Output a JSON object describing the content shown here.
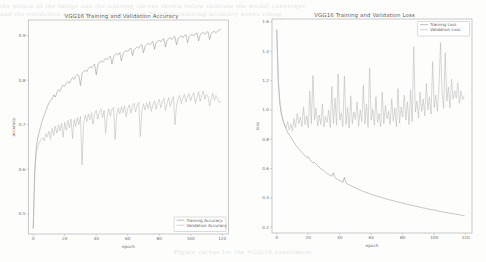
{
  "page": {
    "background_color": "#fdfdfc",
    "ghost_text_top_1": "the  nature  of  the  image  and  the  training  curves  shown  below  indicate  the  model  converges",
    "ghost_text_top_2": "and  the  validation  accuracy  plateaus  near  0.75  while  training  accuracy  keeps  rising",
    "ghost_text_bottom": "Figure  curves  for  the  VGG16  experiment"
  },
  "colors": {
    "training": "#8f8f8f",
    "validation": "#b4b4b4",
    "axis": "#a9a9a9",
    "text": "#6b6b6b"
  },
  "charts": [
    {
      "id": "accuracy-chart",
      "title": "VGG16 Training and Validation Accuracy",
      "xlabel": "epoch",
      "ylabel": "accuracy",
      "legend_position": "lower right",
      "legend": [
        "Training Accuracy",
        "Validation Accuracy"
      ]
    },
    {
      "id": "loss-chart",
      "title": "VGG16 Training and Validation Loss",
      "xlabel": "epoch",
      "ylabel": "loss",
      "legend_position": "upper right",
      "legend": [
        "Training Loss",
        "Validation Loss"
      ]
    }
  ],
  "chart_data": [
    {
      "type": "line",
      "title": "VGG16 Training and Validation Accuracy",
      "xlabel": "epoch",
      "ylabel": "accuracy",
      "xlim": [
        -3,
        124
      ],
      "ylim": [
        0.455,
        0.935
      ],
      "xticks": [
        0,
        20,
        40,
        60,
        80,
        100,
        120
      ],
      "yticks": [
        0.5,
        0.6,
        0.7,
        0.8,
        0.9
      ],
      "xticklabels": [
        "0",
        "20",
        "40",
        "60",
        "80",
        "100",
        "120"
      ],
      "yticklabels": [
        "0.5",
        "0.6",
        "0.7",
        "0.8",
        "0.9"
      ],
      "grid": false,
      "legend": [
        "Training Accuracy",
        "Validation Accuracy"
      ],
      "legend_position": "lower right",
      "x": [
        0,
        1,
        2,
        3,
        4,
        5,
        6,
        7,
        8,
        9,
        10,
        11,
        12,
        13,
        14,
        15,
        16,
        17,
        18,
        19,
        20,
        21,
        22,
        23,
        24,
        25,
        26,
        27,
        28,
        29,
        30,
        31,
        32,
        33,
        34,
        35,
        36,
        37,
        38,
        39,
        40,
        41,
        42,
        43,
        44,
        45,
        46,
        47,
        48,
        49,
        50,
        51,
        52,
        53,
        54,
        55,
        56,
        57,
        58,
        59,
        60,
        61,
        62,
        63,
        64,
        65,
        66,
        67,
        68,
        69,
        70,
        71,
        72,
        73,
        74,
        75,
        76,
        77,
        78,
        79,
        80,
        81,
        82,
        83,
        84,
        85,
        86,
        87,
        88,
        89,
        90,
        91,
        92,
        93,
        94,
        95,
        96,
        97,
        98,
        99,
        100,
        101,
        102,
        103,
        104,
        105,
        106,
        107,
        108,
        109,
        110,
        111,
        112,
        113,
        114,
        115,
        116,
        117,
        118,
        119
      ],
      "series": [
        {
          "name": "Training Accuracy",
          "color": "#8f8f8f",
          "values": [
            0.468,
            0.601,
            0.652,
            0.672,
            0.686,
            0.7,
            0.712,
            0.722,
            0.731,
            0.741,
            0.749,
            0.755,
            0.758,
            0.767,
            0.762,
            0.772,
            0.779,
            0.775,
            0.784,
            0.789,
            0.786,
            0.793,
            0.797,
            0.793,
            0.801,
            0.806,
            0.802,
            0.809,
            0.813,
            0.81,
            0.788,
            0.815,
            0.82,
            0.822,
            0.819,
            0.826,
            0.83,
            0.827,
            0.833,
            0.836,
            0.812,
            0.834,
            0.84,
            0.843,
            0.84,
            0.845,
            0.849,
            0.846,
            0.851,
            0.854,
            0.836,
            0.852,
            0.857,
            0.86,
            0.857,
            0.862,
            0.843,
            0.859,
            0.864,
            0.867,
            0.864,
            0.869,
            0.872,
            0.855,
            0.868,
            0.872,
            0.875,
            0.872,
            0.877,
            0.88,
            0.861,
            0.876,
            0.88,
            0.883,
            0.879,
            0.884,
            0.887,
            0.869,
            0.883,
            0.887,
            0.89,
            0.886,
            0.891,
            0.893,
            0.874,
            0.889,
            0.893,
            0.895,
            0.891,
            0.896,
            0.898,
            0.879,
            0.894,
            0.897,
            0.9,
            0.895,
            0.9,
            0.902,
            0.884,
            0.898,
            0.901,
            0.903,
            0.899,
            0.904,
            0.906,
            0.888,
            0.901,
            0.905,
            0.907,
            0.903,
            0.907,
            0.909,
            0.891,
            0.904,
            0.908,
            0.91,
            0.906,
            0.91,
            0.912,
            0.914
          ]
        },
        {
          "name": "Validation Accuracy",
          "color": "#b4b4b4",
          "values": [
            0.468,
            0.591,
            0.64,
            0.653,
            0.662,
            0.667,
            0.671,
            0.664,
            0.68,
            0.673,
            0.686,
            0.668,
            0.692,
            0.676,
            0.697,
            0.681,
            0.7,
            0.686,
            0.703,
            0.672,
            0.706,
            0.688,
            0.71,
            0.693,
            0.713,
            0.669,
            0.712,
            0.696,
            0.716,
            0.7,
            0.719,
            0.61,
            0.703,
            0.722,
            0.707,
            0.724,
            0.711,
            0.727,
            0.701,
            0.725,
            0.732,
            0.713,
            0.729,
            0.735,
            0.716,
            0.732,
            0.681,
            0.72,
            0.736,
            0.719,
            0.734,
            0.739,
            0.667,
            0.722,
            0.738,
            0.724,
            0.741,
            0.727,
            0.743,
            0.718,
            0.736,
            0.745,
            0.726,
            0.742,
            0.748,
            0.729,
            0.744,
            0.75,
            0.673,
            0.731,
            0.747,
            0.733,
            0.749,
            0.736,
            0.752,
            0.73,
            0.745,
            0.754,
            0.735,
            0.75,
            0.757,
            0.738,
            0.753,
            0.759,
            0.732,
            0.748,
            0.761,
            0.741,
            0.755,
            0.763,
            0.7,
            0.744,
            0.758,
            0.766,
            0.748,
            0.76,
            0.768,
            0.751,
            0.762,
            0.77,
            0.754,
            0.765,
            0.772,
            0.748,
            0.76,
            0.774,
            0.752,
            0.766,
            0.776,
            0.757,
            0.768,
            0.763,
            0.742,
            0.758,
            0.771,
            0.755,
            0.766,
            0.76,
            0.75,
            0.752
          ]
        }
      ]
    },
    {
      "type": "line",
      "title": "VGG16 Training and Validation Loss",
      "xlabel": "epoch",
      "ylabel": "loss",
      "xlim": [
        -3,
        124
      ],
      "ylim": [
        0.16,
        1.62
      ],
      "xticks": [
        0,
        20,
        40,
        60,
        80,
        100,
        120
      ],
      "yticks": [
        0.2,
        0.4,
        0.6,
        0.8,
        1.0,
        1.2,
        1.4,
        1.6
      ],
      "xticklabels": [
        "0",
        "20",
        "40",
        "60",
        "80",
        "100",
        "120"
      ],
      "yticklabels": [
        "0.2",
        "0.4",
        "0.6",
        "0.8",
        "1.0",
        "1.2",
        "1.4",
        "1.6"
      ],
      "grid": false,
      "legend": [
        "Training Loss",
        "Validation Loss"
      ],
      "legend_position": "upper right",
      "x": [
        0,
        1,
        2,
        3,
        4,
        5,
        6,
        7,
        8,
        9,
        10,
        11,
        12,
        13,
        14,
        15,
        16,
        17,
        18,
        19,
        20,
        21,
        22,
        23,
        24,
        25,
        26,
        27,
        28,
        29,
        30,
        31,
        32,
        33,
        34,
        35,
        36,
        37,
        38,
        39,
        40,
        41,
        42,
        43,
        44,
        45,
        46,
        47,
        48,
        49,
        50,
        51,
        52,
        53,
        54,
        55,
        56,
        57,
        58,
        59,
        60,
        61,
        62,
        63,
        64,
        65,
        66,
        67,
        68,
        69,
        70,
        71,
        72,
        73,
        74,
        75,
        76,
        77,
        78,
        79,
        80,
        81,
        82,
        83,
        84,
        85,
        86,
        87,
        88,
        89,
        90,
        91,
        92,
        93,
        94,
        95,
        96,
        97,
        98,
        99,
        100,
        101,
        102,
        103,
        104,
        105,
        106,
        107,
        108,
        109,
        110,
        111,
        112,
        113,
        114,
        115,
        116,
        117,
        118,
        119
      ],
      "series": [
        {
          "name": "Training Loss",
          "color": "#8f8f8f",
          "values": [
            1.545,
            1.19,
            1.04,
            0.965,
            0.925,
            0.895,
            0.87,
            0.845,
            0.83,
            0.812,
            0.795,
            0.778,
            0.762,
            0.748,
            0.735,
            0.722,
            0.708,
            0.7,
            0.688,
            0.675,
            0.68,
            0.66,
            0.648,
            0.638,
            0.642,
            0.628,
            0.618,
            0.61,
            0.6,
            0.592,
            0.585,
            0.575,
            0.566,
            0.56,
            0.552,
            0.548,
            0.572,
            0.538,
            0.53,
            0.525,
            0.518,
            0.512,
            0.506,
            0.54,
            0.5,
            0.494,
            0.488,
            0.482,
            0.478,
            0.472,
            0.468,
            0.462,
            0.458,
            0.452,
            0.448,
            0.444,
            0.44,
            0.436,
            0.432,
            0.428,
            0.424,
            0.42,
            0.418,
            0.414,
            0.41,
            0.408,
            0.404,
            0.4,
            0.398,
            0.394,
            0.392,
            0.388,
            0.386,
            0.382,
            0.38,
            0.377,
            0.374,
            0.372,
            0.369,
            0.366,
            0.364,
            0.361,
            0.358,
            0.356,
            0.353,
            0.351,
            0.348,
            0.346,
            0.343,
            0.341,
            0.338,
            0.336,
            0.334,
            0.331,
            0.329,
            0.327,
            0.324,
            0.322,
            0.32,
            0.318,
            0.316,
            0.314,
            0.311,
            0.309,
            0.307,
            0.305,
            0.303,
            0.301,
            0.299,
            0.297,
            0.295,
            0.293,
            0.291,
            0.289,
            0.287,
            0.286,
            0.284,
            0.282,
            0.28,
            0.278
          ]
        },
        {
          "name": "Validation Loss",
          "color": "#b4b4b4",
          "values": [
            1.545,
            1.2,
            1.055,
            0.98,
            0.935,
            0.9,
            0.88,
            0.92,
            0.862,
            0.905,
            0.855,
            0.94,
            0.88,
            0.975,
            0.905,
            0.95,
            0.885,
            1.02,
            0.9,
            0.96,
            0.88,
            1.13,
            0.905,
            1.235,
            0.93,
            1.01,
            0.89,
            0.965,
            0.9,
            1.04,
            0.885,
            0.955,
            0.915,
            1.0,
            0.88,
            1.16,
            0.905,
            1.08,
            0.895,
            1.245,
            0.93,
            0.98,
            0.885,
            1.23,
            0.9,
            1.015,
            0.875,
            1.095,
            0.905,
            0.985,
            0.935,
            1.055,
            0.89,
            1.0,
            0.92,
            1.17,
            0.905,
            1.04,
            0.88,
            1.285,
            0.93,
            1.005,
            0.895,
            1.09,
            0.915,
            0.975,
            0.885,
            1.12,
            0.905,
            1.03,
            0.94,
            0.99,
            0.9,
            1.075,
            0.925,
            1.01,
            0.885,
            1.145,
            0.91,
            1.02,
            0.95,
            1.1,
            0.93,
            1.055,
            0.9,
            1.135,
            0.92,
            1.43,
            0.985,
            1.06,
            0.945,
            1.12,
            0.99,
            1.075,
            0.96,
            1.18,
            1.0,
            1.09,
            0.97,
            1.33,
            1.015,
            1.1,
            0.99,
            1.145,
            1.46,
            1.12,
            1.01,
            1.39,
            1.06,
            1.155,
            1.015,
            1.21,
            1.075,
            1.13,
            1.08,
            1.185,
            1.045,
            1.13,
            1.07,
            1.095,
            1.105,
            1.12
          ]
        }
      ]
    }
  ]
}
